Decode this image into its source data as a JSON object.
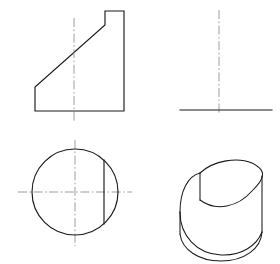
{
  "sheet": {
    "title": "Orthographic and isometric drawing of cylinder with angled cut",
    "width": 280,
    "height": 264,
    "background_color": "#ffffff",
    "object_line_color": "#1a1a1a",
    "center_line_color": "#8c8c8c"
  },
  "views": {
    "front": {
      "name": "front-view",
      "description": "Front elevation: trapezoidal profile with stepped top-right riser and inclined top face",
      "outline_points": "35,111 35,87 105,25 105,11 124,11 124,111 35,111",
      "centerline": {
        "x": 74,
        "y1": 18,
        "y2": 122
      }
    },
    "side": {
      "name": "side-view",
      "description": "Right side view: single horizontal base line with vertical centerline",
      "base_line": {
        "x1": 180,
        "x2": 272,
        "y": 110
      },
      "centerline": {
        "x": 219,
        "y1": 10,
        "y2": 114
      }
    },
    "top": {
      "name": "top-view",
      "description": "Top view: circle with vertical chord representing the flat cut face",
      "circle": {
        "cx": 75,
        "cy": 192,
        "r": 43
      },
      "chord": {
        "x": 104,
        "y1": 160,
        "y2": 224
      },
      "centerline_horizontal": {
        "y": 192,
        "x1": 18,
        "x2": 132
      },
      "centerline_vertical": {
        "x": 75,
        "y1": 140,
        "y2": 246
      }
    },
    "isometric": {
      "name": "isometric-view",
      "description": "Pictorial: upright cylinder with an angled planar cut and a flat vertical face on the upper left",
      "left_silhouette": {
        "x": 180,
        "y_top": 212,
        "y_bottom": 234
      },
      "right_silhouette": {
        "x": 262,
        "y_top": 176,
        "y_bottom": 231
      },
      "bottom_arc": "M180,234 Q221,265 262,231",
      "top_ellipse_arc": "M200,173 Q228,156 258,169 Q265,173 262,178",
      "cut_face_edge": "M200,173 L200,199",
      "cut_ellipse": "M200,199 Q238,219 262,176",
      "lower_body_arc": "M180,212 Q180,174 200,173",
      "cut_lower_arc": "M180,212 Q185,256 224,258 Q254,259 262,231"
    }
  }
}
